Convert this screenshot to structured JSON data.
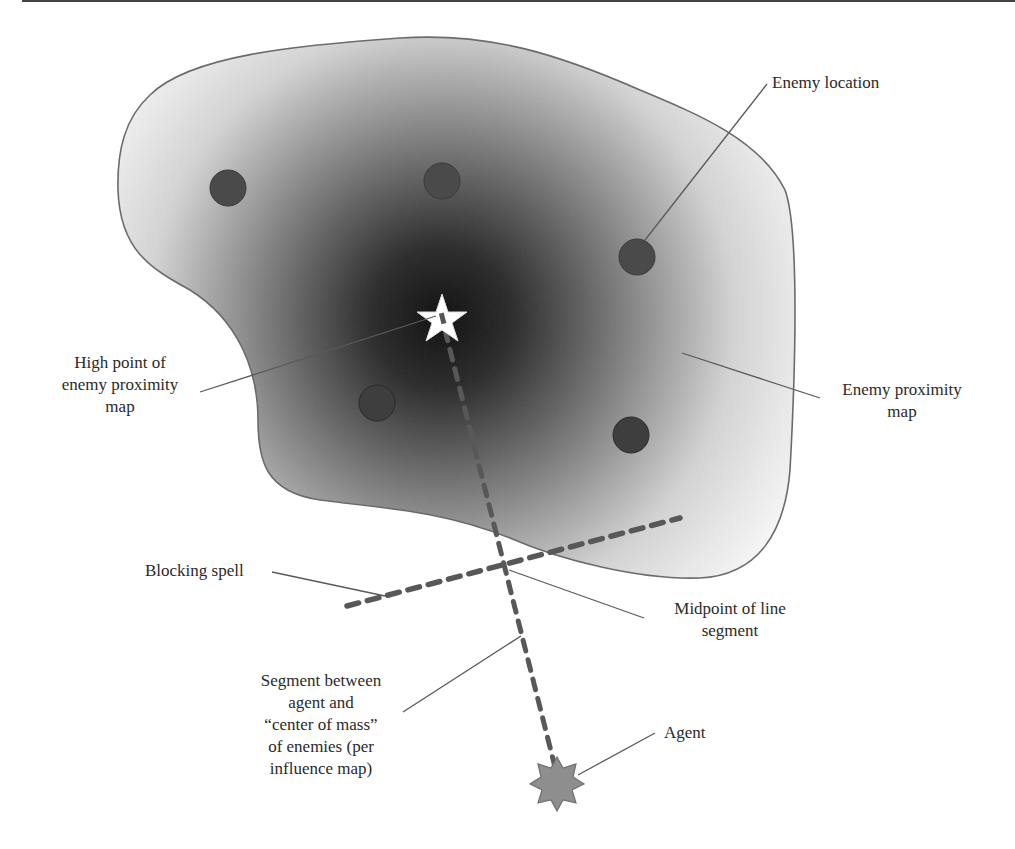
{
  "figure": {
    "colors": {
      "map_core": "#0e0e0e",
      "map_edge": "#f4f4f4",
      "outline": "#6a6a6a",
      "enemy_fill": "#4a4a4a",
      "dash": "#585858",
      "agent_fill": "#8e8e8e",
      "high_point_fill": "#ffffff",
      "leader": "#5a5a5a",
      "text": "#2a2a2a"
    },
    "elements": {
      "proximity_map": {
        "name": "Enemy proximity map",
        "high_point": [
          442,
          318
        ]
      },
      "enemies": [
        {
          "x": 228,
          "y": 188
        },
        {
          "x": 442,
          "y": 181
        },
        {
          "x": 637,
          "y": 257
        },
        {
          "x": 377,
          "y": 403
        },
        {
          "x": 631,
          "y": 435
        }
      ],
      "segment": {
        "from": [
          442,
          318
        ],
        "to": [
          557,
          775
        ]
      },
      "blocking_spell": {
        "from": [
          345,
          607
        ],
        "to": [
          680,
          518
        ]
      },
      "midpoint": [
        507,
        568
      ],
      "agent": [
        557,
        780
      ]
    },
    "labels": {
      "enemy_location": "Enemy location",
      "high_point": [
        "High point of",
        "enemy proximity",
        "map"
      ],
      "proximity_map": [
        "Enemy proximity",
        "map"
      ],
      "blocking_spell": "Blocking spell",
      "midpoint": [
        "Midpoint of line",
        "segment"
      ],
      "segment": [
        "Segment between",
        "agent and",
        "“center of mass”",
        "of enemies (per",
        "influence map)"
      ],
      "agent": "Agent"
    }
  }
}
